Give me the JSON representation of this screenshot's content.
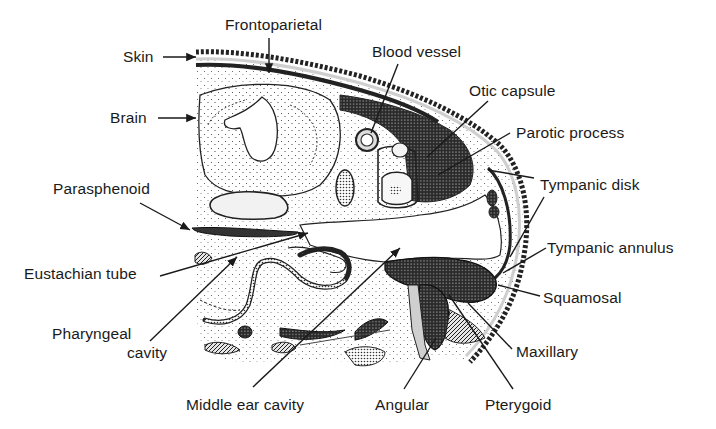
{
  "figure": {
    "background": "#ffffff",
    "ink": "#1a1a1a"
  },
  "labels": [
    {
      "id": "frontoparietal",
      "text": "Frontoparietal",
      "x": 225,
      "y": 17
    },
    {
      "id": "skin",
      "text": "Skin",
      "x": 123,
      "y": 49
    },
    {
      "id": "blood-vessel",
      "text": "Blood vessel",
      "x": 372,
      "y": 44
    },
    {
      "id": "otic-capsule",
      "text": "Otic capsule",
      "x": 469,
      "y": 83
    },
    {
      "id": "brain",
      "text": "Brain",
      "x": 110,
      "y": 110
    },
    {
      "id": "parotic-process",
      "text": "Parotic process",
      "x": 516,
      "y": 125
    },
    {
      "id": "tympanic-disk",
      "text": "Tympanic disk",
      "x": 540,
      "y": 177
    },
    {
      "id": "parasphenoid",
      "text": "Parasphenoid",
      "x": 53,
      "y": 181
    },
    {
      "id": "tympanic-annulus",
      "text": "Tympanic annulus",
      "x": 547,
      "y": 240
    },
    {
      "id": "eustachian-tube",
      "text": "Eustachian tube",
      "x": 24,
      "y": 266
    },
    {
      "id": "squamosal",
      "text": "Squamosal",
      "x": 543,
      "y": 290
    },
    {
      "id": "pharyngeal-cavity-1",
      "text": "Pharyngeal",
      "x": 52,
      "y": 326
    },
    {
      "id": "pharyngeal-cavity-2",
      "text": "cavity",
      "x": 127,
      "y": 345
    },
    {
      "id": "maxillary",
      "text": "Maxillary",
      "x": 516,
      "y": 344
    },
    {
      "id": "middle-ear-cavity",
      "text": "Middle ear cavity",
      "x": 186,
      "y": 397
    },
    {
      "id": "angular",
      "text": "Angular",
      "x": 375,
      "y": 397
    },
    {
      "id": "pterygoid",
      "text": "Pterygoid",
      "x": 485,
      "y": 397
    }
  ],
  "leaders": [
    {
      "id": "skin",
      "x1": 163,
      "y1": 57,
      "x2": 196,
      "y2": 57,
      "arrow": true
    },
    {
      "id": "frontoparietal",
      "x1": 269,
      "y1": 38,
      "x2": 269,
      "y2": 73,
      "arrow": true
    },
    {
      "id": "brain",
      "x1": 158,
      "y1": 118,
      "x2": 196,
      "y2": 118,
      "arrow": true
    },
    {
      "id": "blood-vessel",
      "x1": 398,
      "y1": 64,
      "x2": 371,
      "y2": 133,
      "arrow": false
    },
    {
      "id": "otic-capsule",
      "x1": 488,
      "y1": 101,
      "x2": 427,
      "y2": 157,
      "arrow": false
    },
    {
      "id": "parotic-process",
      "x1": 510,
      "y1": 133,
      "x2": 438,
      "y2": 175,
      "arrow": false
    },
    {
      "id": "tympanic-disk",
      "x1": 534,
      "y1": 178,
      "x2": 488,
      "y2": 170,
      "arrow": false
    },
    {
      "id": "parasphenoid",
      "x1": 140,
      "y1": 203,
      "x2": 190,
      "y2": 230,
      "arrow": true
    },
    {
      "id": "eustachian-tube",
      "x1": 160,
      "y1": 276,
      "x2": 308,
      "y2": 233,
      "arrow": true
    },
    {
      "id": "pharyngeal-cavity",
      "x1": 150,
      "y1": 341,
      "x2": 237,
      "y2": 257,
      "arrow": true
    },
    {
      "id": "middle-ear-cavity",
      "x1": 253,
      "y1": 387,
      "x2": 400,
      "y2": 248,
      "arrow": true
    },
    {
      "id": "tympanic-disk-2",
      "x1": 544,
      "y1": 197,
      "x2": 510,
      "y2": 257,
      "arrow": false
    },
    {
      "id": "tympanic-annulus",
      "x1": 546,
      "y1": 248,
      "x2": 503,
      "y2": 273,
      "arrow": false
    },
    {
      "id": "squamosal",
      "x1": 540,
      "y1": 296,
      "x2": 498,
      "y2": 285,
      "arrow": false
    },
    {
      "id": "maxillary",
      "x1": 512,
      "y1": 349,
      "x2": 468,
      "y2": 303,
      "arrow": false
    },
    {
      "id": "pterygoid",
      "x1": 513,
      "y1": 389,
      "x2": 449,
      "y2": 295,
      "arrow": false
    },
    {
      "id": "angular",
      "x1": 404,
      "y1": 389,
      "x2": 436,
      "y2": 338,
      "arrow": false
    }
  ]
}
